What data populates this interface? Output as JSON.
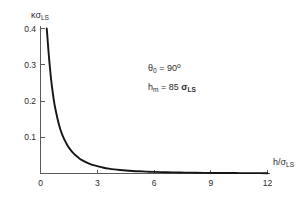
{
  "chart_data": {
    "type": "line",
    "title": "",
    "subtitle": "",
    "xlabel": "h/σLS",
    "ylabel": "κσLS",
    "xlabel_parts": {
      "main": "h/σ",
      "sub": "LS"
    },
    "ylabel_parts": {
      "main": "κσ",
      "sub": "LS"
    },
    "xlim": [
      0,
      12
    ],
    "ylim": [
      0,
      0.4
    ],
    "xticks": [
      0,
      3,
      6,
      9,
      12
    ],
    "xtick_labels": [
      "0",
      "3",
      "6",
      "9",
      "12"
    ],
    "yticks": [
      0.1,
      0.2,
      0.3,
      0.4
    ],
    "ytick_labels": [
      "0.1",
      "0.2",
      "0.3",
      "0.4"
    ],
    "grid": false,
    "legend": null,
    "series": [
      {
        "name": "kappa-sigma-LS",
        "color": "#151515",
        "x": [
          0.33,
          0.36,
          0.4,
          0.45,
          0.5,
          0.56,
          0.63,
          0.7,
          0.78,
          0.87,
          0.96,
          1.06,
          1.17,
          1.29,
          1.42,
          1.56,
          1.71,
          1.87,
          2.04,
          2.22,
          2.42,
          2.63,
          2.85,
          3.09,
          3.34,
          3.61,
          3.9,
          4.2,
          4.52,
          4.86,
          5.22,
          5.6,
          6.0,
          6.5,
          7.0,
          7.6,
          8.2,
          8.9,
          9.6,
          10.3,
          11.0,
          11.6,
          12.0
        ],
        "y": [
          0.4,
          0.381,
          0.352,
          0.32,
          0.291,
          0.26,
          0.23,
          0.204,
          0.18,
          0.158,
          0.138,
          0.12,
          0.1045,
          0.0905,
          0.0782,
          0.0673,
          0.0578,
          0.0495,
          0.0423,
          0.0361,
          0.0306,
          0.0261,
          0.0222,
          0.0188,
          0.0159,
          0.0135,
          0.0114,
          0.0097,
          0.0082,
          0.007,
          0.006,
          0.0051,
          0.0044,
          0.0036,
          0.003,
          0.0025,
          0.0021,
          0.0017,
          0.0014,
          0.0012,
          0.001,
          0.0009,
          0.0008
        ]
      }
    ],
    "annotations": [
      {
        "id": "theta-0",
        "text": "θ₀ = 90°",
        "parts": {
          "symbol": "θ",
          "sub": "0",
          "eq": " = 90",
          "sup": "o"
        }
      },
      {
        "id": "h-m",
        "text": "hₘ = 85 σLS",
        "parts": {
          "symbol": "h",
          "sub": "m",
          "eq": " = 85 ",
          "unit": "σ",
          "unit_sub": "LS"
        }
      }
    ],
    "colors": {
      "curve": "#151515",
      "axis": "#5a5a5a",
      "text": "#2b2b2b",
      "background": "#ffffff"
    }
  }
}
